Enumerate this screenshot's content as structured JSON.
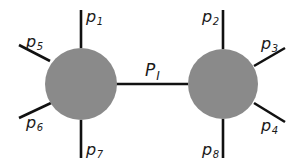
{
  "diagram": {
    "type": "two-vertex particle exchange diagram",
    "colors": {
      "background": "#ffffff",
      "vertex_fill": "#8a8a8a",
      "line": "#111111",
      "text": "#1a1a1a"
    },
    "vertices": [
      {
        "id": "left-vertex",
        "cx": 81,
        "cy": 84,
        "r": 36
      },
      {
        "id": "right-vertex",
        "cx": 223,
        "cy": 84,
        "r": 35
      }
    ],
    "propagator": {
      "label_main": "P",
      "label_sub": "I",
      "x1": 116,
      "y1": 84,
      "x2": 188,
      "y2": 84
    },
    "legs": [
      {
        "id": "p1",
        "main": "p",
        "sub": "1",
        "x1": 81,
        "y1": 10,
        "x2": 81,
        "y2": 48,
        "lx": 86,
        "ly": 22
      },
      {
        "id": "p5",
        "main": "p",
        "sub": "5",
        "x1": 19,
        "y1": 45,
        "x2": 50,
        "y2": 61,
        "lx": 26,
        "ly": 47
      },
      {
        "id": "p6",
        "main": "p",
        "sub": "6",
        "x1": 19,
        "y1": 118,
        "x2": 51,
        "y2": 103,
        "lx": 26,
        "ly": 128
      },
      {
        "id": "p7",
        "main": "p",
        "sub": "7",
        "x1": 81,
        "y1": 120,
        "x2": 81,
        "y2": 158,
        "lx": 86,
        "ly": 155
      },
      {
        "id": "p2",
        "main": "p",
        "sub": "2",
        "x1": 223,
        "y1": 10,
        "x2": 223,
        "y2": 49,
        "lx": 202,
        "ly": 22
      },
      {
        "id": "p3",
        "main": "p",
        "sub": "3",
        "x1": 285,
        "y1": 48,
        "x2": 254,
        "y2": 66,
        "lx": 261,
        "ly": 49
      },
      {
        "id": "p4",
        "main": "p",
        "sub": "4",
        "x1": 254,
        "y1": 103,
        "x2": 285,
        "y2": 122,
        "lx": 261,
        "ly": 131
      },
      {
        "id": "p8",
        "main": "p",
        "sub": "8",
        "x1": 223,
        "y1": 119,
        "x2": 223,
        "y2": 158,
        "lx": 202,
        "ly": 155
      }
    ]
  }
}
